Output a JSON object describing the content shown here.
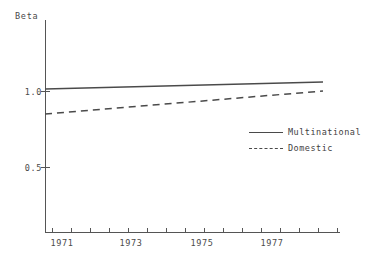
{
  "chart_data": {
    "type": "line",
    "title": "",
    "xlabel": "",
    "ylabel": "Beta",
    "xlim": [
      1970.3,
      1978.3
    ],
    "ylim": [
      0.0,
      1.4
    ],
    "grid": false,
    "legend_position": "center-right",
    "x_ticklabels": [
      "1971",
      "1973",
      "1975",
      "1977"
    ],
    "x_tickvalues": [
      1971,
      1973,
      1975,
      1977
    ],
    "y_ticklabels": [
      "1.0",
      "0.5"
    ],
    "y_tickvalues": [
      1.0,
      0.5
    ],
    "x_minor_tickvalues": [
      1970.5,
      1971,
      1971.5,
      1972,
      1972.5,
      1973,
      1973.5,
      1974,
      1974.5,
      1975,
      1975.5,
      1976,
      1976.5,
      1977,
      1977.5,
      1978
    ],
    "series": [
      {
        "name": "Multinational",
        "style": "solid",
        "color": "#4a4a4a",
        "x": [
          1970.3,
          1978.3
        ],
        "values": [
          1.01,
          1.06
        ]
      },
      {
        "name": "Domestic",
        "style": "dashed",
        "color": "#4a4a4a",
        "x": [
          1970.3,
          1978.3
        ],
        "values": [
          0.845,
          1.0
        ]
      }
    ]
  },
  "axes": {
    "y_title": "Beta",
    "y_ticks": [
      {
        "label": "1.0",
        "top": 87
      },
      {
        "label": "0.5",
        "top": 163
      }
    ],
    "x_ticks": [
      {
        "label": "1971",
        "left": 62
      },
      {
        "label": "1973",
        "left": 131
      },
      {
        "label": "1975",
        "left": 202
      },
      {
        "label": "1977",
        "left": 272
      }
    ],
    "x_minor_positions": [
      52,
      71,
      90,
      109,
      128,
      147,
      166,
      185,
      204,
      223,
      242,
      261,
      280,
      299,
      318,
      337
    ]
  },
  "legend": {
    "entries": [
      {
        "label": "Multinational",
        "style": "solid"
      },
      {
        "label": "Domestic",
        "style": "dashed"
      }
    ]
  }
}
